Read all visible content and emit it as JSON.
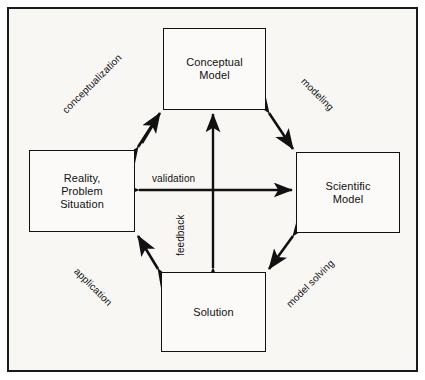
{
  "diagram": {
    "type": "cycle-diagram",
    "background_color": "#f8f7f4",
    "line_color": "#111111",
    "frame": {
      "border_color": "#1a1a1a"
    },
    "nodes": [
      {
        "id": "conceptual",
        "label": "Conceptual\nModel",
        "line1": "Conceptual",
        "line2": "Model",
        "position": "top"
      },
      {
        "id": "reality",
        "label": "Reality,\nProblem\nSituation",
        "line1": "Reality,",
        "line2": "Problem",
        "line3": "Situation",
        "position": "left"
      },
      {
        "id": "scientific",
        "label": "Scientific\nModel",
        "line1": "Scientific",
        "line2": "Model",
        "position": "right"
      },
      {
        "id": "solution",
        "label": "Solution",
        "line1": "Solution",
        "position": "bottom"
      }
    ],
    "edges": [
      {
        "id": "conceptualization",
        "label": "conceptualization",
        "from": "reality",
        "to": "conceptual",
        "arrowheads": "both",
        "orientation": "diagonal-up-right"
      },
      {
        "id": "modeling",
        "label": "modeling",
        "from": "conceptual",
        "to": "scientific",
        "arrowheads": "both",
        "orientation": "diagonal-down-right"
      },
      {
        "id": "model-solving",
        "label": "model solving",
        "from": "scientific",
        "to": "solution",
        "arrowheads": "both",
        "orientation": "diagonal-down-left"
      },
      {
        "id": "application",
        "label": "application",
        "from": "solution",
        "to": "reality",
        "arrowheads": "both",
        "orientation": "diagonal-up-left"
      },
      {
        "id": "validation",
        "label": "validation",
        "from": "reality",
        "to": "scientific",
        "arrowheads": "both",
        "orientation": "horizontal"
      },
      {
        "id": "feedback",
        "label": "feedback",
        "from": "conceptual",
        "to": "solution",
        "arrowheads": "both",
        "orientation": "vertical"
      }
    ]
  }
}
